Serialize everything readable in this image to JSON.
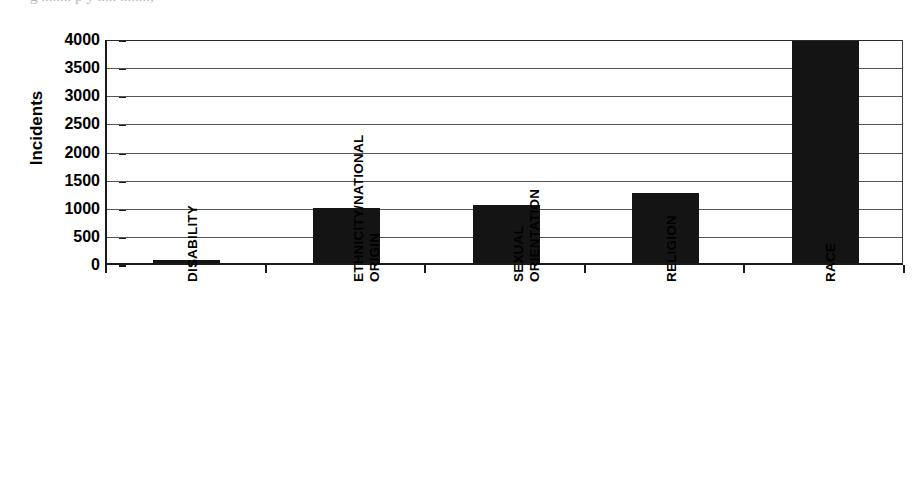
{
  "page": {
    "top_fragment_text": "g  ........  p   y  .....  ........,"
  },
  "chart_data": {
    "type": "bar",
    "title": "",
    "subtitle": "",
    "xlabel": "",
    "ylabel": "Incidents",
    "categories": [
      "DISABILITY",
      "ETHNICITY/NATIONAL ORIGIN",
      "SEXUAL ORIENTATION",
      "RELIGION",
      "RACE"
    ],
    "category_lines": [
      [
        "DISABILITY"
      ],
      [
        "ETHNICITY/NATIONAL",
        "ORIGIN"
      ],
      [
        "SEXUAL",
        "ORIENTATION"
      ],
      [
        "RELIGION"
      ],
      [
        "RACE"
      ]
    ],
    "values": [
      60,
      970,
      1040,
      1250,
      3950
    ],
    "ylim": [
      0,
      4000
    ],
    "ytick_values": [
      0,
      500,
      1000,
      1500,
      2000,
      2500,
      3000,
      3500,
      4000
    ],
    "ytick_labels": [
      "0",
      "500",
      "1000",
      "1500",
      "2000",
      "2500",
      "3000",
      "3500",
      "4000"
    ],
    "grid": true,
    "legend": null,
    "bar_color": "#141414",
    "axis_color": "#1a1a1a",
    "grid_color": "#555555",
    "background_color": "#ffffff"
  }
}
